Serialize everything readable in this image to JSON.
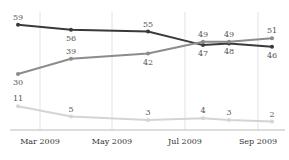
{
  "chart_data": {
    "type": "line",
    "title": "",
    "xlabel": "",
    "ylabel": "",
    "x": [
      "Feb 2009",
      "Apr 2009",
      "Jun 2009",
      "Jul 2009",
      "Aug 2009",
      "Sep 2009"
    ],
    "x_ticks": [
      "Mar 2009",
      "May 2009",
      "Jul 2009",
      "Sep 2009"
    ],
    "series": [
      {
        "name": "Series 1",
        "color": "#3a3a3a",
        "values": [
          59,
          56,
          55,
          47,
          48,
          46
        ]
      },
      {
        "name": "Series 2",
        "color": "#8c8c8c",
        "values": [
          30,
          39,
          42,
          49,
          49,
          51
        ]
      },
      {
        "name": "Series 3",
        "color": "#d4d4d4",
        "values": [
          11,
          5,
          3,
          4,
          3,
          2
        ]
      }
    ],
    "ylim": [
      0,
      62
    ],
    "grid": "vertical",
    "legend": "none"
  }
}
